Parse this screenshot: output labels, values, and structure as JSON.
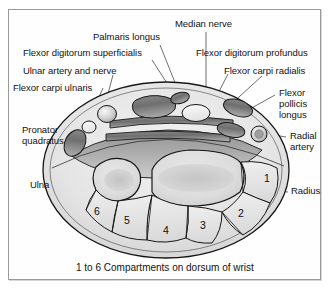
{
  "figure": {
    "caption": "1 to 6 Compartments on dorsum of wrist",
    "colors": {
      "ink": "#131313",
      "outline": "#1a1a1a",
      "leader": "#555555",
      "frame": "#9a9a9a",
      "tissue_light": "#e3e3e3",
      "tissue_mid": "#c8c8c8",
      "tissue_dark": "#9a9a9a",
      "tendon_dark": "#7a7a7a",
      "tendon_light": "#efefef",
      "bone_fill": "#dddddd"
    }
  },
  "labels": [
    {
      "id": "median-nerve",
      "text": "Median nerve"
    },
    {
      "id": "palmaris-longus",
      "text": "Palmaris longus"
    },
    {
      "id": "flexor-digitorum-superficialis",
      "text": "Flexor digitorum superficialis"
    },
    {
      "id": "flexor-digitorum-profundus",
      "text": "Flexor digitorum profundus"
    },
    {
      "id": "ulnar-artery-and-nerve",
      "text": "Ulnar artery and nerve"
    },
    {
      "id": "flexor-carpi-radialis",
      "text": "Flexor carpi radialis"
    },
    {
      "id": "flexor-carpi-ulnaris",
      "text": "Flexor carpi ulnaris"
    },
    {
      "id": "flexor-pollicis-longus",
      "text": "Flexor pollicis longus"
    },
    {
      "id": "pronator-quadratus",
      "text": "Pronator quadratus"
    },
    {
      "id": "radial-artery",
      "text": "Radial artery"
    },
    {
      "id": "ulna",
      "text": "Ulna"
    },
    {
      "id": "radius",
      "text": "Radius"
    }
  ],
  "label_text": {
    "median_nerve": "Median nerve",
    "palmaris_longus": "Palmaris longus",
    "flexor_digitorum_superficialis": "Flexor digitorum superficialis",
    "flexor_digitorum_profundus": "Flexor digitorum profundus",
    "ulnar_artery_and_nerve": "Ulnar artery and nerve",
    "flexor_carpi_radialis": "Flexor carpi radialis",
    "flexor_carpi_ulnaris": "Flexor carpi ulnaris",
    "flexor_pollicis_longus_l1": "Flexor",
    "flexor_pollicis_longus_l2": "pollicis",
    "flexor_pollicis_longus_l3": "longus",
    "pronator_quadratus_l1": "Pronator",
    "pronator_quadratus_l2": "quadratus",
    "radial_artery_l1": "Radial",
    "radial_artery_l2": "artery",
    "ulna": "Ulna",
    "radius": "Radius"
  },
  "compartments": {
    "heading": "1 to 6 Compartments on dorsum of wrist",
    "items": [
      {
        "number": "1"
      },
      {
        "number": "2"
      },
      {
        "number": "3"
      },
      {
        "number": "4"
      },
      {
        "number": "5"
      },
      {
        "number": "6"
      }
    ]
  }
}
